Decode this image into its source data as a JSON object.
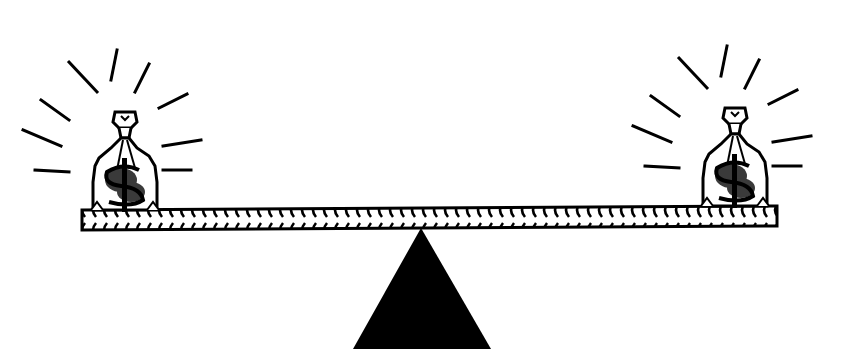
{
  "image": {
    "description": "Balanced seesaw scale with a money bag on each end",
    "colors": {
      "background": "#ffffff",
      "ink": "#000000",
      "dollar_fill": "#3a3a3a"
    }
  },
  "left_bag": {
    "symbol": "$",
    "icon": "money-bag-icon"
  },
  "right_bag": {
    "symbol": "$",
    "icon": "money-bag-icon"
  },
  "fulcrum": {
    "icon": "triangle-fulcrum-icon"
  },
  "beam": {
    "icon": "braided-beam"
  }
}
